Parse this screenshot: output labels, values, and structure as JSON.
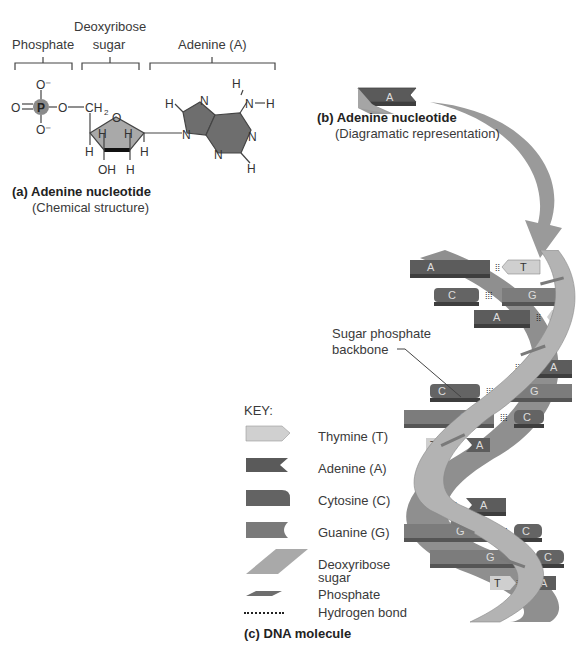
{
  "part_a": {
    "brackets": {
      "phosphate": "Phosphate",
      "sugar_line1": "Deoxyribose",
      "sugar_line2": "sugar",
      "adenine": "Adenine (A)"
    },
    "atoms": {
      "P": "P",
      "O_top": "O⁻",
      "O_bottom": "O⁻",
      "O_left": "O",
      "O_link": "O",
      "CH2": "CH",
      "CH2_sub": "2",
      "O_ring": "O",
      "H1": "H",
      "H2": "H",
      "H3": "H",
      "H4": "H",
      "H5": "H",
      "OH": "OH",
      "H6": "H",
      "N_amine": "N",
      "H_amine_top": "H",
      "H_amine_right": "H",
      "H_ring_left": "H",
      "H_ring_bottom": "H",
      "N7": "N",
      "N9": "N",
      "N1": "N",
      "N3": "N"
    },
    "caption_title": "(a) Adenine nucleotide",
    "caption_sub": "(Chemical structure)"
  },
  "part_b": {
    "block_label": "A",
    "caption_title": "(b) Adenine nucleotide",
    "caption_sub": "(Diagramatic representation)"
  },
  "part_c": {
    "backbone_label_line1": "Sugar phosphate",
    "backbone_label_line2": "backbone",
    "key_title": "KEY:",
    "key": [
      {
        "name": "Thymine (T)",
        "color": "#c9c9c9"
      },
      {
        "name": "Adenine (A)",
        "color": "#5a5a5a"
      },
      {
        "name": "Cytosine (C)",
        "color": "#6a6a6a"
      },
      {
        "name": "Guanine (G)",
        "color": "#7a7a7a"
      },
      {
        "name": "Deoxyribose sugar",
        "line1": "Deoxyribose",
        "line2": "sugar",
        "color": "#a8a8a8"
      },
      {
        "name": "Phosphate",
        "color": "#6e6e6e"
      },
      {
        "name": "Hydrogen bond",
        "color": "#222222"
      }
    ],
    "base_pairs": [
      {
        "left": "A",
        "right": "T"
      },
      {
        "left": "C",
        "right": "G"
      },
      {
        "left": "A",
        "right": "T"
      },
      {
        "left": "",
        "right": "A"
      },
      {
        "left": "C",
        "right": "G"
      },
      {
        "left": "G",
        "right": "C"
      },
      {
        "left": "T",
        "right": "A"
      },
      {
        "left": "T",
        "right": "A"
      },
      {
        "left": "G",
        "right": "C"
      },
      {
        "left": "G",
        "right": "C"
      },
      {
        "left": "T",
        "right": "A"
      }
    ],
    "caption_title": "(c) DNA molecule"
  },
  "colors": {
    "adenine": "#5a5a5a",
    "thymine": "#cfcfcf",
    "cytosine": "#646464",
    "guanine": "#7c7c7c",
    "backbone": "#a9a9a9",
    "backbone_dark": "#8a8a8a",
    "arrow": "#9a9a9a",
    "text": "#3a3a3a"
  }
}
